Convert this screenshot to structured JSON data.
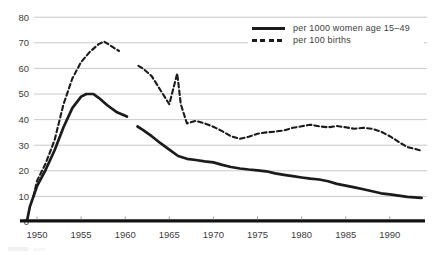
{
  "chart_data": {
    "type": "line",
    "title": "",
    "xlabel": "",
    "ylabel": "",
    "x_ticks": [
      1950,
      1955,
      1960,
      1965,
      1970,
      1975,
      1980,
      1985,
      1990
    ],
    "y_ticks": [
      0,
      10,
      20,
      30,
      40,
      50,
      60,
      70,
      80
    ],
    "xlim": [
      1948.5,
      1993.8
    ],
    "ylim": [
      0,
      80
    ],
    "grid": true,
    "legend_position": "top-right",
    "series": [
      {
        "name": "per 1000 women age 15–49",
        "line_style": "solid",
        "color": "#1b1b1b",
        "segments": [
          [
            [
              1948.9,
              1
            ],
            [
              1949.2,
              6
            ],
            [
              1950,
              14
            ],
            [
              1951,
              20.5
            ],
            [
              1952,
              28
            ],
            [
              1953,
              37
            ],
            [
              1954,
              44.5
            ],
            [
              1955,
              49
            ],
            [
              1955.6,
              50
            ],
            [
              1956.4,
              50
            ],
            [
              1957,
              48.5
            ],
            [
              1958,
              45.5
            ],
            [
              1959,
              43
            ],
            [
              1960.2,
              41.2
            ]
          ],
          [
            [
              1961.4,
              37.3
            ],
            [
              1962,
              36
            ],
            [
              1963,
              33.5
            ],
            [
              1964,
              30.8
            ],
            [
              1965,
              28.3
            ],
            [
              1966,
              25.8
            ],
            [
              1967,
              24.7
            ],
            [
              1968,
              24.2
            ],
            [
              1969,
              23.7
            ],
            [
              1970,
              23.3
            ],
            [
              1971,
              22.3
            ],
            [
              1972,
              21.5
            ],
            [
              1973,
              20.9
            ],
            [
              1974,
              20.5
            ],
            [
              1975,
              20.2
            ],
            [
              1976,
              19.8
            ],
            [
              1977,
              19
            ],
            [
              1978,
              18.4
            ],
            [
              1979,
              17.9
            ],
            [
              1980,
              17.4
            ],
            [
              1981,
              16.9
            ],
            [
              1982,
              16.6
            ],
            [
              1983,
              15.9
            ],
            [
              1984,
              14.9
            ],
            [
              1985,
              14.2
            ],
            [
              1986,
              13.5
            ],
            [
              1987,
              12.8
            ],
            [
              1988,
              12
            ],
            [
              1989,
              11.2
            ],
            [
              1990,
              10.8
            ],
            [
              1991,
              10.3
            ],
            [
              1992,
              9.8
            ],
            [
              1993.6,
              9.4
            ]
          ]
        ]
      },
      {
        "name": "per 100 births",
        "line_style": "dashed",
        "color": "#1b1b1b",
        "segments": [
          [
            [
              1949.6,
              10
            ],
            [
              1950,
              16
            ],
            [
              1951,
              23
            ],
            [
              1952,
              32
            ],
            [
              1953,
              46
            ],
            [
              1954,
              56
            ],
            [
              1955,
              62.5
            ],
            [
              1956,
              66.5
            ],
            [
              1957,
              69.5
            ],
            [
              1957.6,
              70.5
            ],
            [
              1958.3,
              69
            ],
            [
              1959.3,
              66.8
            ]
          ],
          [
            [
              1961.5,
              61
            ],
            [
              1962,
              60
            ],
            [
              1963,
              57
            ],
            [
              1964,
              51.5
            ],
            [
              1965,
              46
            ],
            [
              1965.9,
              58
            ],
            [
              1966.3,
              46
            ],
            [
              1967,
              38.5
            ],
            [
              1968,
              39.5
            ],
            [
              1969,
              38.5
            ],
            [
              1970,
              37.2
            ],
            [
              1971,
              35.5
            ],
            [
              1972,
              33.5
            ],
            [
              1973,
              32.5
            ],
            [
              1974,
              33.3
            ],
            [
              1975,
              34.5
            ],
            [
              1976,
              35
            ],
            [
              1977,
              35.3
            ],
            [
              1978,
              35.8
            ],
            [
              1979,
              36.8
            ],
            [
              1980,
              37.4
            ],
            [
              1981,
              38
            ],
            [
              1982,
              37.4
            ],
            [
              1983,
              37
            ],
            [
              1984,
              37.5
            ],
            [
              1985,
              37
            ],
            [
              1986,
              36.4
            ],
            [
              1987,
              36.8
            ],
            [
              1988,
              36.4
            ],
            [
              1989,
              35.3
            ],
            [
              1990,
              33.5
            ],
            [
              1991,
              31.3
            ],
            [
              1992,
              29.3
            ],
            [
              1993.4,
              28
            ]
          ]
        ]
      }
    ]
  },
  "colors": {
    "background": "#ffffff",
    "grid": "#bdbdbd",
    "axis": "#121212",
    "tick_label": "#3d3d3d",
    "legend_text": "#3d3d3d"
  }
}
